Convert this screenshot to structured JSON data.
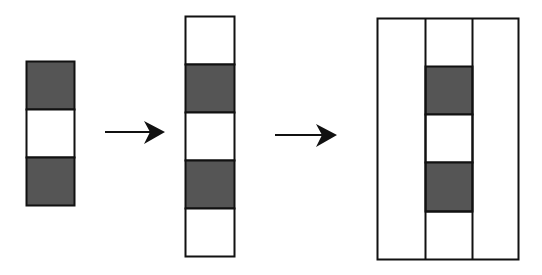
{
  "diagram": {
    "colors": {
      "stroke": "#111111",
      "dark": "#555555",
      "light": "#ffffff"
    },
    "stages": [
      {
        "id": "stage-1",
        "cells": [
          "dark",
          "light",
          "dark"
        ]
      },
      {
        "id": "stage-2",
        "cells": [
          "light",
          "dark",
          "light",
          "dark",
          "light"
        ]
      },
      {
        "id": "stage-3",
        "side_columns": 2,
        "middle_cells": [
          "light",
          "dark",
          "light",
          "dark",
          "light"
        ]
      }
    ],
    "arrows": [
      {
        "from": "stage-1",
        "to": "stage-2"
      },
      {
        "from": "stage-2",
        "to": "stage-3"
      }
    ]
  }
}
